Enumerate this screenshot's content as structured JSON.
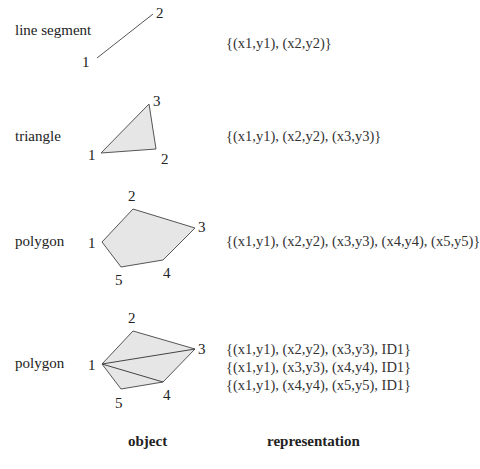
{
  "rows": [
    {
      "name": "line segment",
      "vertices": [
        {
          "id": "1",
          "x": 97,
          "y": 58
        },
        {
          "id": "2",
          "x": 153,
          "y": 14
        }
      ],
      "representation": [
        "{(x1,y1), (x2,y2)}"
      ]
    },
    {
      "name": "triangle",
      "vertices": [
        {
          "id": "1",
          "x": 101,
          "y": 153
        },
        {
          "id": "2",
          "x": 156,
          "y": 149
        },
        {
          "id": "3",
          "x": 149,
          "y": 104
        }
      ],
      "representation": [
        "{(x1,y1), (x2,y2), (x3,y3)}"
      ]
    },
    {
      "name": "polygon",
      "vertices": [
        {
          "id": "1",
          "x": 102,
          "y": 242
        },
        {
          "id": "2",
          "x": 133,
          "y": 209
        },
        {
          "id": "3",
          "x": 195,
          "y": 228
        },
        {
          "id": "4",
          "x": 163,
          "y": 260
        },
        {
          "id": "5",
          "x": 121,
          "y": 267
        }
      ],
      "representation": [
        "{(x1,y1), (x2,y2), (x3,y3), (x4,y4), (x5,y5)}"
      ]
    },
    {
      "name": "polygon",
      "vertices": [
        {
          "id": "1",
          "x": 102,
          "y": 364
        },
        {
          "id": "2",
          "x": 133,
          "y": 331
        },
        {
          "id": "3",
          "x": 195,
          "y": 349
        },
        {
          "id": "4",
          "x": 163,
          "y": 382
        },
        {
          "id": "5",
          "x": 121,
          "y": 389
        }
      ],
      "triangulated": true,
      "representation": [
        "{(x1,y1), (x2,y2), (x3,y3), ID1}",
        "{(x1,y1), (x3,y3), (x4,y4), ID1}",
        "{(x1,y1), (x4,y4), (x5,y5), ID1}"
      ]
    }
  ],
  "headers": {
    "object": "object",
    "representation": "representation"
  },
  "colors": {
    "fill": "#e6e6e6",
    "stroke": "#555555"
  }
}
